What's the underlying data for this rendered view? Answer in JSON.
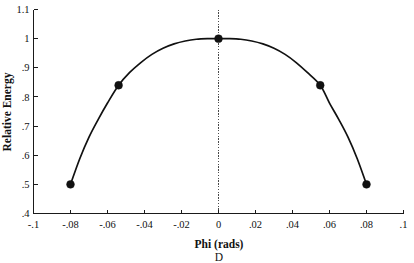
{
  "chart_data": {
    "type": "line",
    "title": "",
    "subtitle": "",
    "xlabel": "Phi (rads)",
    "ylabel": "Relative Energy",
    "panel_label": "D",
    "xlim": [
      -0.1,
      0.1
    ],
    "ylim": [
      0.4,
      1.1
    ],
    "xticks": [
      -0.1,
      -0.08,
      -0.06,
      -0.04,
      -0.02,
      0,
      0.02,
      0.04,
      0.06,
      0.08,
      0.1
    ],
    "xticklabels": [
      "-.1",
      "-.08",
      "-.06",
      "-.04",
      "-.02",
      "0",
      ".02",
      ".04",
      ".06",
      ".08",
      ".1"
    ],
    "yticks": [
      0.4,
      0.5,
      0.6,
      0.7,
      0.8,
      0.9,
      1.0,
      1.1
    ],
    "yticklabels": [
      ".4",
      ".5",
      ".6",
      ".7",
      ".8",
      ".9",
      "1",
      "1.1"
    ],
    "grid": false,
    "legend": "none",
    "annotations": [
      {
        "name": "zero-reference-line",
        "type": "vline",
        "x": 0,
        "style": "dotted"
      }
    ],
    "series": [
      {
        "name": "Relative Energy",
        "marker": "circle",
        "color": "#111111",
        "x": [
          -0.08,
          -0.054,
          0.0,
          0.055,
          0.08
        ],
        "y": [
          0.5,
          0.84,
          1.0,
          0.84,
          0.5
        ]
      }
    ],
    "fit_curve": {
      "name": "smooth-fit",
      "description": "smooth inverted-parabola-like curve through data points",
      "x": [
        -0.08,
        -0.075,
        -0.07,
        -0.065,
        -0.06,
        -0.054,
        -0.048,
        -0.042,
        -0.036,
        -0.03,
        -0.024,
        -0.018,
        -0.012,
        -0.006,
        0.0,
        0.006,
        0.012,
        0.018,
        0.024,
        0.03,
        0.036,
        0.042,
        0.048,
        0.055,
        0.06,
        0.065,
        0.07,
        0.075,
        0.08
      ],
      "y": [
        0.5,
        0.588,
        0.662,
        0.723,
        0.779,
        0.84,
        0.884,
        0.918,
        0.946,
        0.967,
        0.982,
        0.992,
        0.998,
        1.0,
        1.0,
        1.0,
        0.998,
        0.992,
        0.982,
        0.967,
        0.946,
        0.918,
        0.884,
        0.84,
        0.779,
        0.723,
        0.662,
        0.588,
        0.5
      ]
    }
  },
  "colors": {
    "axis": "#1a1a1a",
    "data": "#111111",
    "reference_line": "#4a4a4a",
    "background": "#ffffff"
  }
}
